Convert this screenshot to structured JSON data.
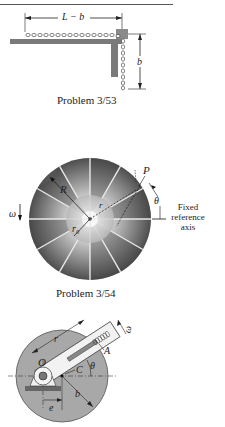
{
  "figures": [
    {
      "id": "fig-3-53",
      "caption": "Problem 3/53",
      "labels": {
        "horizontal_length": "L − b",
        "vertical_length": "b"
      }
    },
    {
      "id": "fig-3-54",
      "caption": "Problem 3/54",
      "labels": {
        "omega": "ω",
        "R": "R",
        "r": "r",
        "r0": "r₀",
        "P": "P",
        "theta": "θ",
        "reference": "Fixed\nreference\naxis",
        "reference_lines": [
          "Fixed",
          "reference",
          "axis"
        ]
      }
    },
    {
      "id": "fig-3-55",
      "labels": {
        "r": "r",
        "omega": "ω",
        "O": "O",
        "A": "A",
        "C": "C",
        "theta": "θ",
        "b": "b",
        "e": "e"
      }
    }
  ],
  "colors": {
    "ink": "#222222",
    "plate": "#7a7a7a",
    "disk_dark": "#5e5e5e",
    "disk_light": "#bdbdbd",
    "hub": "#d9d9d9",
    "round_plate": "#a8a8a8"
  }
}
